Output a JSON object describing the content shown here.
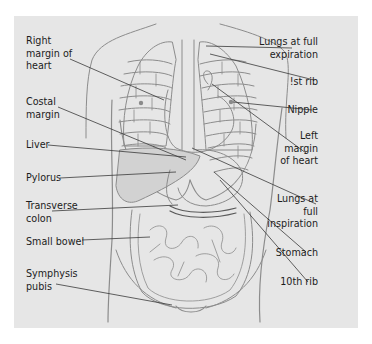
{
  "figure": {
    "colors": {
      "background": "#ffffff",
      "panel": "#e6e6e6",
      "text": "#1c1c1c",
      "leader_line": "#3a3a3a",
      "anatomy_line": "#8c8c8c",
      "organ_fill": "#bdbdbd"
    }
  },
  "labels": {
    "left": [
      {
        "id": "right-margin-of-heart",
        "text": "Right\nmargin of\nheart"
      },
      {
        "id": "costal-margin",
        "text": "Costal\nmargin"
      },
      {
        "id": "liver",
        "text": "Liver"
      },
      {
        "id": "pylorus",
        "text": "Pylorus"
      },
      {
        "id": "transverse-colon",
        "text": "Transverse\ncolon"
      },
      {
        "id": "small-bowel",
        "text": "Small bowel"
      },
      {
        "id": "symphysis-pubis",
        "text": "Symphysis\npubis"
      }
    ],
    "right": [
      {
        "id": "lungs-full-expiration",
        "text": "Lungs at full\nexpiration"
      },
      {
        "id": "first-rib",
        "text": "!st rib"
      },
      {
        "id": "nipple",
        "text": "Nipple"
      },
      {
        "id": "left-margin-of-heart",
        "text": "Left\nmargin\nof heart"
      },
      {
        "id": "lungs-full-inspiration",
        "text": "Lungs at\nfull\ninspiration"
      },
      {
        "id": "stomach",
        "text": "Stomach"
      },
      {
        "id": "tenth-rib",
        "text": "10th rib"
      }
    ]
  }
}
